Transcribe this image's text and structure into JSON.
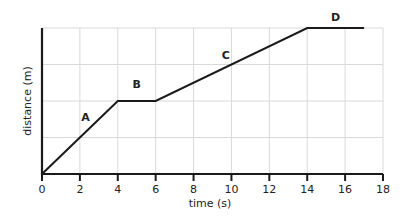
{
  "chart_data": {
    "type": "line",
    "title": "",
    "xlabel": "time (s)",
    "ylabel": "distance (m)",
    "xlim": [
      0,
      18
    ],
    "ylim": [
      0,
      4
    ],
    "xticks": [
      0,
      2,
      4,
      6,
      8,
      10,
      12,
      14,
      16,
      18
    ],
    "yticks_labeled": false,
    "y_gridlines": 4,
    "grid": true,
    "series": [
      {
        "name": "distance-time",
        "x": [
          0,
          4,
          6,
          14,
          17
        ],
        "y": [
          0,
          2,
          2,
          4,
          4
        ]
      }
    ],
    "annotations": [
      {
        "text": "A",
        "x": 2.3,
        "y": 1.45,
        "segment": "0-4 s"
      },
      {
        "text": "B",
        "x": 5.0,
        "y": 2.35,
        "segment": "4-6 s"
      },
      {
        "text": "C",
        "x": 9.7,
        "y": 3.15,
        "segment": "6-14 s"
      },
      {
        "text": "D",
        "x": 15.5,
        "y": 4.2,
        "segment": "14-17 s"
      }
    ]
  },
  "colors": {
    "line": "#1a1a1a",
    "grid": "#d9d9d9",
    "axis": "#1a1a1a"
  }
}
